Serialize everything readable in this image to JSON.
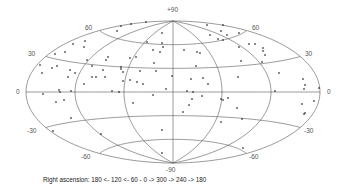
{
  "chart_data": {
    "type": "scatter",
    "projection": "aitoff",
    "title": "",
    "xlabel": "Right ascension: 180 <- 120 <- 60 - 0 -> 300 -> 240 -> 180",
    "ylabel": "Declination",
    "ylim": [
      -90,
      90
    ],
    "xlim": [
      0,
      360
    ],
    "grid": true,
    "declination_lines": [
      -60,
      -30,
      0,
      30,
      60
    ],
    "ra_meridians": [
      0,
      60,
      120,
      180,
      240,
      300
    ],
    "dec_tick_labels": [
      "+90",
      "60",
      "30",
      "0",
      "-30",
      "-60",
      "-90"
    ],
    "legend": [],
    "points_px": [
      [
        121,
        26
      ],
      [
        131,
        24
      ],
      [
        146,
        22
      ],
      [
        117,
        31
      ],
      [
        162,
        33
      ],
      [
        207,
        25
      ],
      [
        223,
        25
      ],
      [
        221,
        31
      ],
      [
        227,
        35
      ],
      [
        239,
        33
      ],
      [
        73,
        44
      ],
      [
        85,
        41
      ],
      [
        84,
        47
      ],
      [
        147,
        42
      ],
      [
        162,
        43
      ],
      [
        210,
        35
      ],
      [
        218,
        39
      ],
      [
        223,
        40
      ],
      [
        249,
        44
      ],
      [
        255,
        44
      ],
      [
        239,
        47
      ],
      [
        263,
        48
      ],
      [
        263,
        51
      ],
      [
        265,
        55
      ],
      [
        65,
        52
      ],
      [
        55,
        54
      ],
      [
        153,
        50
      ],
      [
        160,
        52
      ],
      [
        163,
        47
      ],
      [
        184,
        50
      ],
      [
        197,
        52
      ],
      [
        200,
        53
      ],
      [
        241,
        61
      ],
      [
        87,
        60
      ],
      [
        106,
        60
      ],
      [
        108,
        57
      ],
      [
        130,
        58
      ],
      [
        136,
        57
      ],
      [
        154,
        63
      ],
      [
        262,
        62
      ],
      [
        40,
        65
      ],
      [
        52,
        68
      ],
      [
        57,
        66
      ],
      [
        70,
        70
      ],
      [
        75,
        73
      ],
      [
        92,
        66
      ],
      [
        103,
        70
      ],
      [
        121,
        67
      ],
      [
        121,
        69
      ],
      [
        123,
        72
      ],
      [
        140,
        71
      ],
      [
        156,
        71
      ],
      [
        172,
        76
      ],
      [
        196,
        66
      ],
      [
        191,
        79
      ],
      [
        203,
        78
      ],
      [
        208,
        84
      ],
      [
        238,
        77
      ],
      [
        279,
        73
      ],
      [
        42,
        73
      ],
      [
        68,
        77
      ],
      [
        84,
        84
      ],
      [
        92,
        77
      ],
      [
        96,
        77
      ],
      [
        105,
        77
      ],
      [
        123,
        81
      ],
      [
        130,
        80
      ],
      [
        137,
        82
      ],
      [
        143,
        84
      ],
      [
        166,
        89
      ],
      [
        303,
        79
      ],
      [
        305,
        85
      ],
      [
        304,
        89
      ],
      [
        319,
        88
      ],
      [
        43,
        94
      ],
      [
        59,
        90
      ],
      [
        60,
        92
      ],
      [
        71,
        91
      ],
      [
        112,
        91
      ],
      [
        119,
        92
      ],
      [
        187,
        91
      ],
      [
        193,
        92
      ],
      [
        275,
        91
      ],
      [
        153,
        95
      ],
      [
        192,
        99
      ],
      [
        202,
        96
      ],
      [
        221,
        99
      ],
      [
        223,
        100
      ],
      [
        228,
        98
      ],
      [
        56,
        102
      ],
      [
        64,
        100
      ],
      [
        133,
        103
      ],
      [
        189,
        105
      ],
      [
        237,
        108
      ],
      [
        302,
        104
      ],
      [
        314,
        101
      ],
      [
        183,
        112
      ],
      [
        305,
        113
      ],
      [
        304,
        114
      ],
      [
        71,
        118
      ],
      [
        242,
        119
      ],
      [
        221,
        122
      ],
      [
        53,
        131
      ],
      [
        162,
        130
      ],
      [
        101,
        134
      ],
      [
        243,
        148
      ],
      [
        162,
        153
      ]
    ]
  },
  "labels": {
    "dec_p90": "+90",
    "dec_m90": "-90",
    "dec_60_left": "60",
    "dec_60_right": "60",
    "dec_30_left": "30",
    "dec_30_right": "30",
    "dec_0_left": "0",
    "dec_0_right": "0",
    "dec_m30_left": "-30",
    "dec_m30_right": "-30",
    "dec_m60_left": "-60",
    "dec_m60_right": "-60"
  },
  "caption": "Right ascension: 180 <- 120 <- 60 - 0 -> 300 -> 240 -> 180"
}
